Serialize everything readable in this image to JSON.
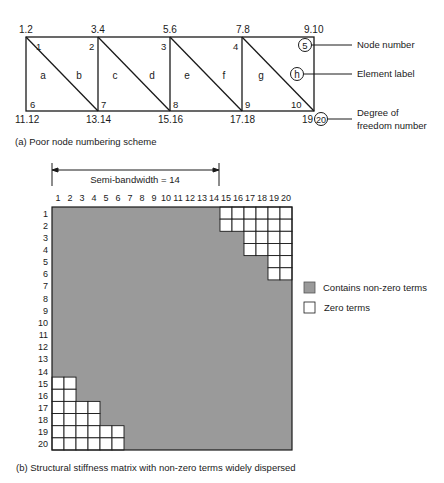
{
  "figure_a": {
    "caption": "(a) Poor node numbering scheme",
    "dof_top": [
      "1.2",
      "3.4",
      "5.6",
      "7.8",
      "9.10"
    ],
    "dof_bottom": [
      "11.12",
      "13.14",
      "15.16",
      "17.18",
      "19"
    ],
    "dof_circled": "20",
    "nodes_top": [
      "1",
      "2",
      "3",
      "4",
      "5"
    ],
    "nodes_bottom": [
      "6",
      "7",
      "8",
      "9",
      "10"
    ],
    "elements": [
      "a",
      "b",
      "c",
      "d",
      "e",
      "f",
      "g",
      "h"
    ],
    "legend": {
      "node_number": "Node number",
      "element_label": "Element label",
      "dof_number_line1": "Degree of",
      "dof_number_line2": "freedom number"
    }
  },
  "figure_b": {
    "caption": "(b) Structural stiffness matrix with non-zero terms widely dispersed",
    "semi_bandwidth_label": "Semi-bandwidth = 14",
    "column_labels": [
      "1",
      "2",
      "3",
      "4",
      "5",
      "6",
      "7",
      "8",
      "9",
      "10",
      "11",
      "12",
      "13",
      "14",
      "15",
      "16",
      "17",
      "18",
      "19",
      "20"
    ],
    "row_labels": [
      "1",
      "2",
      "3",
      "4",
      "5",
      "6",
      "7",
      "8",
      "9",
      "10",
      "11",
      "12",
      "13",
      "14",
      "15",
      "16",
      "17",
      "18",
      "19",
      "20"
    ],
    "legend": {
      "nonzero": "Contains non-zero terms",
      "zero": "Zero terms"
    },
    "colors": {
      "nonzero": "#9a9a9a",
      "zero": "#ffffff",
      "line": "#1a1a1a"
    },
    "zero_blocks_upper": [
      {
        "rows": [
          1,
          2
        ],
        "cols": [
          15,
          20
        ]
      },
      {
        "rows": [
          3,
          4
        ],
        "cols": [
          17,
          20
        ]
      },
      {
        "rows": [
          5,
          6
        ],
        "cols": [
          19,
          20
        ]
      }
    ],
    "zero_blocks_lower": [
      {
        "rows": [
          15,
          16
        ],
        "cols": [
          1,
          2
        ]
      },
      {
        "rows": [
          17,
          18
        ],
        "cols": [
          1,
          4
        ]
      },
      {
        "rows": [
          19,
          20
        ],
        "cols": [
          1,
          6
        ]
      }
    ]
  }
}
